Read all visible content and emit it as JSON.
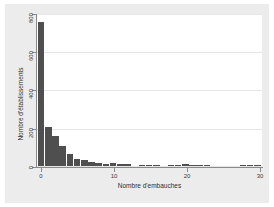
{
  "chart_data": {
    "type": "bar",
    "title": "",
    "subtitle": "",
    "xlabel": "Nombre d'embauches",
    "ylabel": "Nombre d'établissements",
    "xlim": [
      -0.6,
      30.6
    ],
    "ylim": [
      0,
      800
    ],
    "xticks": [
      0,
      10,
      20,
      30
    ],
    "xtick_labels": [
      "0",
      "10",
      "20",
      "30"
    ],
    "yticks": [
      0,
      200,
      400,
      600,
      800
    ],
    "ytick_labels": [
      "0",
      "200",
      "400",
      "600",
      "800"
    ],
    "grid": "horizontal",
    "legend": "none",
    "bar_color": "#4f4f4f",
    "plot_background": "#ffffff",
    "canvas_background": "#ececed",
    "bin_width": 1,
    "categories": [
      0,
      1,
      2,
      3,
      4,
      5,
      6,
      7,
      8,
      9,
      10,
      11,
      12,
      13,
      14,
      15,
      16,
      17,
      18,
      19,
      20,
      21,
      22,
      23,
      24,
      25,
      26,
      27,
      28,
      29,
      30
    ],
    "values": [
      760,
      207,
      160,
      104,
      62,
      38,
      30,
      22,
      14,
      12,
      16,
      11,
      8,
      0,
      5,
      6,
      5,
      0,
      6,
      5,
      9,
      6,
      5,
      6,
      0,
      0,
      0,
      0,
      5,
      7,
      6
    ],
    "series": [
      {
        "name": "Nombre d'établissements",
        "values": [
          760,
          207,
          160,
          104,
          62,
          38,
          30,
          22,
          14,
          12,
          16,
          11,
          8,
          0,
          5,
          6,
          5,
          0,
          6,
          5,
          9,
          6,
          5,
          6,
          0,
          0,
          0,
          0,
          5,
          7,
          6
        ]
      }
    ]
  },
  "figure": {
    "x_axis_title": "Nombre d'embauches",
    "y_axis_title": "Nombre d'établissements"
  },
  "ticks": {
    "y": [
      "0",
      "200",
      "400",
      "600",
      "800"
    ],
    "x": [
      "0",
      "10",
      "20",
      "30"
    ]
  }
}
